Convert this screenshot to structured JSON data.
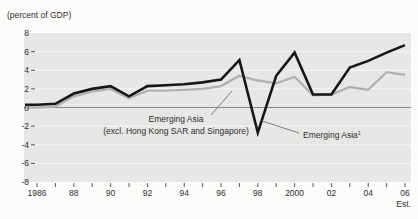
{
  "chart_data": {
    "type": "line",
    "unit_label": "(percent of GDP)",
    "x": [
      1986,
      1987,
      1988,
      1989,
      1990,
      1991,
      1992,
      1993,
      1994,
      1995,
      1996,
      1997,
      1998,
      1999,
      2000,
      2001,
      2002,
      2003,
      2004,
      2005,
      2006
    ],
    "xtick_labels": [
      "1986",
      "88",
      "90",
      "92",
      "94",
      "96",
      "98",
      "2000",
      "02",
      "04",
      "06"
    ],
    "x_note": "Est.",
    "yticks": [
      8,
      6,
      4,
      2,
      0,
      -2,
      -4,
      -6,
      -8
    ],
    "ylim": [
      -8,
      8
    ],
    "grid": "horizontal-white-on-gray-panel",
    "legend_position": "in-chart-annotations",
    "panel_color": "#e7e7e5",
    "zero_line_color": "#8a8a8a",
    "series": [
      {
        "name": "Emerging Asia¹",
        "color": "#161616",
        "values": [
          0.3,
          0.4,
          1.5,
          2.0,
          2.3,
          1.2,
          2.3,
          2.4,
          2.5,
          2.7,
          3.0,
          5.1,
          -2.7,
          3.4,
          5.9,
          1.4,
          1.4,
          4.3,
          5.0,
          5.9,
          6.7
        ]
      },
      {
        "name": "Emerging Asia (excl. Hong Kong SAR and Singapore)",
        "color": "#b1b1af",
        "values": [
          0.0,
          0.1,
          1.2,
          1.7,
          2.0,
          1.0,
          1.8,
          1.8,
          1.9,
          2.0,
          2.3,
          3.4,
          2.9,
          2.6,
          3.3,
          1.3,
          1.4,
          2.2,
          1.9,
          3.8,
          3.5
        ]
      }
    ]
  },
  "labels": {
    "gray_line1": "Emerging Asia",
    "gray_line2": "(excl. Hong Kong SAR and Singapore)",
    "black_name": "Emerging Asia",
    "black_sup": "1",
    "est": "Est."
  }
}
